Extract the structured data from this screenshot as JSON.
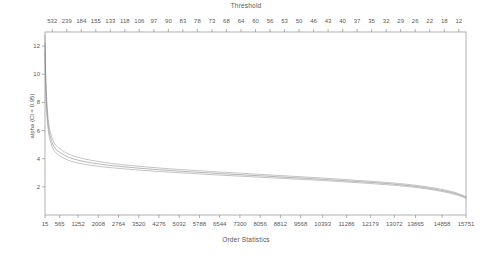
{
  "chart_data": {
    "type": "line",
    "title": "",
    "xlabel": "Order Statistics",
    "ylabel": "alpha (CI  = 0.95)",
    "top_axis_label": "Threshold",
    "grid": false,
    "legend": "none",
    "xlim": [
      15,
      15751
    ],
    "ylim": [
      0,
      13
    ],
    "y_ticks": [
      "12",
      "10",
      "8",
      "6",
      "4",
      "2"
    ],
    "y_tick_values": [
      12,
      10,
      8,
      6,
      4,
      2
    ],
    "x_ticks": [
      "15",
      "565",
      "1252",
      "2008",
      "2764",
      "3520",
      "4276",
      "5032",
      "5788",
      "6544",
      "7300",
      "8056",
      "8812",
      "9568",
      "10393",
      "11286",
      "12179",
      "13072",
      "13865",
      "14858",
      "15751"
    ],
    "x_tick_values": [
      15,
      565,
      1252,
      2008,
      2764,
      3520,
      4276,
      5032,
      5788,
      6544,
      7300,
      8056,
      8812,
      9568,
      10393,
      11286,
      12179,
      13072,
      13865,
      14858,
      15751
    ],
    "top_ticks": [
      "532",
      "239",
      "184",
      "155",
      "133",
      "118",
      "106",
      "97",
      "90",
      "83",
      "78",
      "73",
      "68",
      "64",
      "60",
      "56",
      "53",
      "50",
      "46",
      "43",
      "40",
      "37",
      "35",
      "32",
      "29",
      "26",
      "22",
      "18",
      "12"
    ],
    "top_tick_values": [
      532,
      239,
      184,
      155,
      133,
      118,
      106,
      97,
      90,
      83,
      78,
      73,
      68,
      64,
      60,
      56,
      53,
      50,
      46,
      43,
      40,
      37,
      35,
      32,
      29,
      26,
      22,
      18,
      12
    ],
    "series": [
      {
        "name": "upper 95% confidence limit",
        "color": "#8a8a8a",
        "x": [
          15,
          40,
          70,
          110,
          160,
          220,
          300,
          420,
          565,
          800,
          1100,
          1500,
          2008,
          2600,
          3200,
          3900,
          4700,
          5500,
          6400,
          7300,
          8200,
          9100,
          10000,
          11000,
          12000,
          13000,
          14000,
          14800,
          15300,
          15600,
          15751
        ],
        "values": [
          12.8,
          10.2,
          8.6,
          7.3,
          6.4,
          5.85,
          5.35,
          4.95,
          4.72,
          4.42,
          4.18,
          3.98,
          3.8,
          3.64,
          3.52,
          3.4,
          3.28,
          3.18,
          3.07,
          2.97,
          2.87,
          2.77,
          2.67,
          2.55,
          2.42,
          2.28,
          2.08,
          1.84,
          1.62,
          1.42,
          1.3
        ]
      },
      {
        "name": "alpha estimate",
        "color": "#6f6f6f",
        "x": [
          15,
          40,
          70,
          110,
          160,
          220,
          300,
          420,
          565,
          800,
          1100,
          1500,
          2008,
          2600,
          3200,
          3900,
          4700,
          5500,
          6400,
          7300,
          8200,
          9100,
          10000,
          11000,
          12000,
          13000,
          14000,
          14800,
          15300,
          15600,
          15751
        ],
        "values": [
          12.2,
          9.6,
          8.1,
          6.9,
          6.05,
          5.52,
          5.05,
          4.68,
          4.46,
          4.19,
          3.97,
          3.79,
          3.63,
          3.49,
          3.38,
          3.27,
          3.16,
          3.06,
          2.96,
          2.86,
          2.77,
          2.67,
          2.58,
          2.46,
          2.34,
          2.2,
          2.0,
          1.76,
          1.55,
          1.36,
          1.24
        ]
      },
      {
        "name": "lower 95% confidence limit",
        "color": "#8a8a8a",
        "x": [
          15,
          40,
          70,
          110,
          160,
          220,
          300,
          420,
          565,
          800,
          1100,
          1500,
          2008,
          2600,
          3200,
          3900,
          4700,
          5500,
          6400,
          7300,
          8200,
          9100,
          10000,
          11000,
          12000,
          13000,
          14000,
          14800,
          15300,
          15600,
          15751
        ],
        "values": [
          11.6,
          9.0,
          7.6,
          6.5,
          5.7,
          5.2,
          4.76,
          4.42,
          4.21,
          3.96,
          3.76,
          3.6,
          3.46,
          3.34,
          3.24,
          3.14,
          3.04,
          2.95,
          2.85,
          2.76,
          2.67,
          2.58,
          2.49,
          2.38,
          2.26,
          2.12,
          1.93,
          1.69,
          1.48,
          1.3,
          1.18
        ]
      }
    ]
  }
}
